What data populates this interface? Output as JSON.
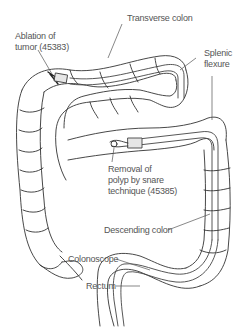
{
  "diagram": {
    "type": "anatomical-illustration",
    "labels": {
      "transverse_colon": "Transverse colon",
      "ablation_line1": "Ablation of",
      "ablation_line2": "tumor (45383)",
      "splenic_line1": "Splenic",
      "splenic_line2": "flexure",
      "removal_line1": "Removal of",
      "removal_line2": "polyp by snare",
      "removal_line3": "technique (45385)",
      "descending_colon": "Descending colon",
      "colonoscope": "Colonoscope",
      "rectum": "Rectum"
    },
    "colors": {
      "line": "#333333",
      "text": "#555555",
      "scope_fill": "#e6e6e6",
      "background": "#ffffff"
    }
  }
}
